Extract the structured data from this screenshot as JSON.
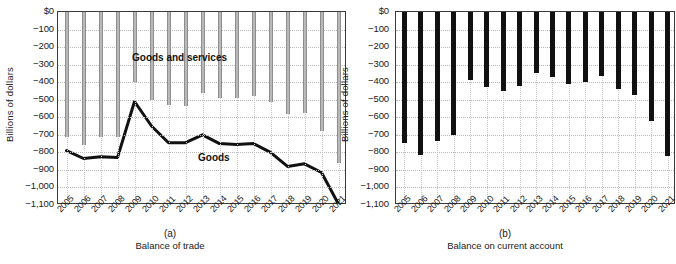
{
  "figure": {
    "axis_y_label": "Billions of dollars",
    "y_ticks": [
      "$0",
      "−100",
      "−200",
      "−300",
      "−400",
      "−500",
      "−600",
      "−700",
      "−800",
      "−900",
      "−1,000",
      "−1,100"
    ],
    "years": [
      "2005",
      "2006",
      "2007",
      "2008",
      "2009",
      "2010",
      "2011",
      "2012",
      "2013",
      "2014",
      "2015",
      "2016",
      "2017",
      "2018",
      "2019",
      "2020",
      "2021"
    ],
    "panel_a": {
      "tag": "(a)",
      "caption": "Balance of trade",
      "label_goods_services": "Goods and services",
      "label_goods": "Goods"
    },
    "panel_b": {
      "tag": "(b)",
      "caption": "Balance on current account"
    },
    "colors": {
      "bar_goods_services": "#b9b9b9",
      "bar_current_account": "#111111",
      "line_goods": "#111111",
      "grid": "#c0c0c0",
      "axis": "#3a3a3a"
    }
  },
  "chart_data": [
    {
      "type": "bar",
      "title": "Balance of trade",
      "panel": "(a)",
      "xlabel": "Balance of trade",
      "ylabel": "Billions of dollars",
      "ylim": [
        -1100,
        0
      ],
      "grid": true,
      "legend": "inline-annotations",
      "categories": [
        "2005",
        "2006",
        "2007",
        "2008",
        "2009",
        "2010",
        "2011",
        "2012",
        "2013",
        "2014",
        "2015",
        "2016",
        "2017",
        "2018",
        "2019",
        "2020",
        "2021"
      ],
      "series": [
        {
          "name": "Goods and services",
          "render": "bar",
          "values": [
            -715,
            -760,
            -710,
            -710,
            -400,
            -500,
            -530,
            -535,
            -460,
            -490,
            -490,
            -480,
            -515,
            -580,
            -575,
            -680,
            -860
          ]
        },
        {
          "name": "Goods",
          "render": "line",
          "values": [
            -790,
            -835,
            -825,
            -830,
            -510,
            -650,
            -745,
            -745,
            -700,
            -750,
            -755,
            -750,
            -800,
            -880,
            -865,
            -915,
            -1095
          ]
        }
      ]
    },
    {
      "type": "bar",
      "title": "Balance on current account",
      "panel": "(b)",
      "xlabel": "Balance on current account",
      "ylabel": "Billions of dollars",
      "ylim": [
        -1100,
        0
      ],
      "grid": true,
      "categories": [
        "2005",
        "2006",
        "2007",
        "2008",
        "2009",
        "2010",
        "2011",
        "2012",
        "2013",
        "2014",
        "2015",
        "2016",
        "2017",
        "2018",
        "2019",
        "2020",
        "2021"
      ],
      "values": [
        -745,
        -815,
        -735,
        -700,
        -385,
        -430,
        -450,
        -420,
        -350,
        -370,
        -410,
        -400,
        -365,
        -440,
        -475,
        -620,
        -820
      ]
    }
  ]
}
